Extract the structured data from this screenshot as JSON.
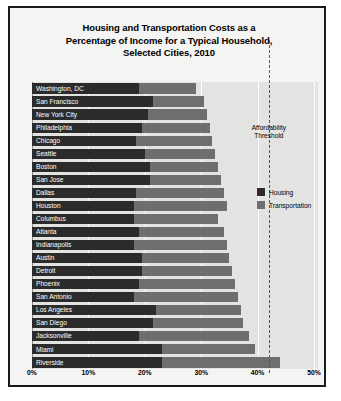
{
  "chart_data": {
    "type": "bar",
    "orientation": "horizontal",
    "stacked": true,
    "title": "Housing and Transportation Costs as a Percentage of Income for a Typical Household, Selected Cities, 2010",
    "title_lines": [
      "Housing and Transportation Costs as a",
      "Percentage of Income for a Typical Household,",
      "Selected Cities, 2010"
    ],
    "xlabel": "",
    "ylabel": "",
    "xlim": [
      0,
      50
    ],
    "xticks": [
      0,
      10,
      20,
      30,
      40,
      50
    ],
    "xtick_labels": [
      "0%",
      "10%",
      "20%",
      "30%",
      "40%",
      "50%"
    ],
    "grid": true,
    "legend_position": "right",
    "categories": [
      "Washington, DC",
      "San Francisco",
      "New York City",
      "Philadelphia",
      "Chicago",
      "Seattle",
      "Boston",
      "San Jose",
      "Dallas",
      "Houston",
      "Columbus",
      "Atlanta",
      "Indianapolis",
      "Austin",
      "Detroit",
      "Phoenix",
      "San Antonio",
      "Los Angeles",
      "San Diego",
      "Jacksonville",
      "Miami",
      "Riverside"
    ],
    "series": [
      {
        "name": "Housing",
        "color": "#2b2b2b",
        "values": [
          19.0,
          21.5,
          20.5,
          19.5,
          18.5,
          20.0,
          21.0,
          21.0,
          18.5,
          18.0,
          18.0,
          19.0,
          18.0,
          19.5,
          19.5,
          19.0,
          18.0,
          22.0,
          21.5,
          19.0,
          23.0,
          23.0
        ]
      },
      {
        "name": "Transportation",
        "color": "#6e6e6e",
        "values": [
          10.0,
          9.0,
          10.5,
          12.0,
          13.5,
          12.5,
          12.0,
          12.5,
          15.5,
          16.5,
          15.0,
          15.0,
          16.5,
          15.5,
          16.0,
          17.0,
          18.5,
          15.0,
          16.0,
          19.5,
          16.5,
          21.0
        ]
      }
    ],
    "totals": [
      29.0,
      30.5,
      31.0,
      31.5,
      32.0,
      32.5,
      33.0,
      33.5,
      34.0,
      34.5,
      33.0,
      34.0,
      34.5,
      35.0,
      35.5,
      36.0,
      36.5,
      37.0,
      37.5,
      38.5,
      39.5,
      44.0
    ],
    "annotations": [
      {
        "name": "affordability-threshold",
        "label_lines": [
          "Affordability",
          "Threshold"
        ],
        "value": 42.0,
        "style": "dashed-vertical-line"
      }
    ]
  },
  "legend": {
    "items": [
      {
        "label": "Housing",
        "color": "#2b2b2b"
      },
      {
        "label": "Transportation",
        "color": "#6e6e6e"
      }
    ]
  }
}
